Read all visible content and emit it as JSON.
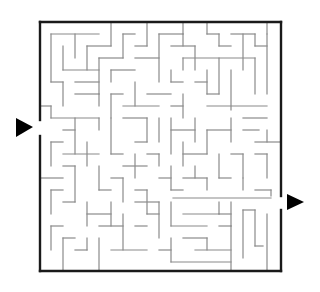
{
  "puzzle": {
    "type": "maze",
    "background": "#ffffff",
    "frame_color": "#1a1a1a",
    "wall_color": "#8a8a8a",
    "arrow_color": "#000000",
    "entrance": {
      "side": "left",
      "label": "entrance-arrow"
    },
    "exit": {
      "side": "right",
      "label": "exit-arrow"
    }
  },
  "frame": {
    "x1": 40,
    "y1": 22,
    "x2": 281,
    "y2": 271
  },
  "walls": [
    [
      51,
      34,
      51,
      82
    ],
    [
      51,
      34,
      99,
      34
    ],
    [
      75,
      34,
      75,
      58
    ],
    [
      63,
      46,
      63,
      70
    ],
    [
      63,
      70,
      99,
      70
    ],
    [
      87,
      46,
      87,
      70
    ],
    [
      111,
      22,
      111,
      46
    ],
    [
      87,
      46,
      111,
      46
    ],
    [
      99,
      58,
      99,
      94
    ],
    [
      99,
      58,
      123,
      58
    ],
    [
      123,
      34,
      123,
      58
    ],
    [
      123,
      34,
      135,
      34
    ],
    [
      135,
      46,
      147,
      46
    ],
    [
      111,
      70,
      135,
      70
    ],
    [
      111,
      70,
      111,
      82
    ],
    [
      147,
      22,
      147,
      46
    ],
    [
      159,
      34,
      159,
      82
    ],
    [
      135,
      58,
      159,
      58
    ],
    [
      159,
      34,
      183,
      34
    ],
    [
      183,
      34,
      183,
      46
    ],
    [
      171,
      46,
      195,
      46
    ],
    [
      195,
      46,
      195,
      70
    ],
    [
      183,
      22,
      183,
      34
    ],
    [
      207,
      22,
      207,
      34
    ],
    [
      207,
      34,
      219,
      34
    ],
    [
      219,
      34,
      219,
      46
    ],
    [
      219,
      46,
      231,
      46
    ],
    [
      231,
      34,
      255,
      34
    ],
    [
      243,
      34,
      243,
      70
    ],
    [
      255,
      34,
      255,
      46
    ],
    [
      255,
      46,
      267,
      46
    ],
    [
      267,
      34,
      267,
      94
    ],
    [
      267,
      22,
      267,
      34
    ],
    [
      183,
      58,
      255,
      58
    ],
    [
      183,
      58,
      183,
      70
    ],
    [
      219,
      58,
      219,
      94
    ],
    [
      207,
      70,
      207,
      94
    ],
    [
      255,
      58,
      255,
      94
    ],
    [
      171,
      82,
      183,
      82
    ],
    [
      171,
      70,
      171,
      82
    ],
    [
      195,
      82,
      207,
      82
    ],
    [
      207,
      94,
      219,
      94
    ],
    [
      231,
      70,
      231,
      110
    ],
    [
      207,
      106,
      267,
      106
    ],
    [
      171,
      106,
      183,
      106
    ],
    [
      183,
      94,
      183,
      118
    ],
    [
      51,
      82,
      63,
      82
    ],
    [
      63,
      82,
      63,
      106
    ],
    [
      75,
      82,
      99,
      82
    ],
    [
      75,
      94,
      99,
      94
    ],
    [
      99,
      94,
      99,
      106
    ],
    [
      111,
      94,
      123,
      94
    ],
    [
      111,
      94,
      111,
      118
    ],
    [
      135,
      82,
      135,
      106
    ],
    [
      123,
      106,
      159,
      106
    ],
    [
      147,
      94,
      171,
      94
    ],
    [
      40,
      106,
      51,
      106
    ],
    [
      51,
      106,
      51,
      118
    ],
    [
      51,
      118,
      99,
      118
    ],
    [
      63,
      130,
      75,
      130
    ],
    [
      75,
      118,
      75,
      154
    ],
    [
      99,
      118,
      99,
      130
    ],
    [
      111,
      118,
      111,
      154
    ],
    [
      111,
      154,
      123,
      154
    ],
    [
      123,
      118,
      147,
      118
    ],
    [
      147,
      118,
      147,
      142
    ],
    [
      135,
      142,
      147,
      142
    ],
    [
      159,
      118,
      159,
      142
    ],
    [
      171,
      118,
      171,
      154
    ],
    [
      171,
      130,
      195,
      130
    ],
    [
      195,
      118,
      195,
      142
    ],
    [
      207,
      130,
      207,
      154
    ],
    [
      207,
      130,
      231,
      130
    ],
    [
      231,
      118,
      231,
      142
    ],
    [
      243,
      118,
      267,
      118
    ],
    [
      243,
      130,
      259,
      130
    ],
    [
      255,
      142,
      281,
      142
    ],
    [
      267,
      130,
      267,
      142
    ],
    [
      51,
      142,
      63,
      142
    ],
    [
      51,
      142,
      51,
      166
    ],
    [
      63,
      154,
      99,
      154
    ],
    [
      87,
      142,
      87,
      166
    ],
    [
      123,
      166,
      147,
      166
    ],
    [
      135,
      154,
      135,
      178
    ],
    [
      147,
      154,
      159,
      154
    ],
    [
      159,
      154,
      159,
      166
    ],
    [
      183,
      142,
      183,
      166
    ],
    [
      183,
      154,
      207,
      154
    ],
    [
      219,
      154,
      219,
      178
    ],
    [
      231,
      154,
      243,
      154
    ],
    [
      243,
      154,
      243,
      178
    ],
    [
      255,
      154,
      267,
      154
    ],
    [
      267,
      154,
      267,
      178
    ],
    [
      40,
      178,
      63,
      178
    ],
    [
      63,
      166,
      75,
      166
    ],
    [
      75,
      166,
      75,
      202
    ],
    [
      99,
      166,
      99,
      190
    ],
    [
      99,
      190,
      111,
      190
    ],
    [
      111,
      178,
      123,
      178
    ],
    [
      123,
      178,
      123,
      202
    ],
    [
      135,
      190,
      147,
      190
    ],
    [
      147,
      190,
      147,
      214
    ],
    [
      159,
      178,
      171,
      178
    ],
    [
      171,
      166,
      171,
      190
    ],
    [
      171,
      190,
      183,
      190
    ],
    [
      195,
      166,
      195,
      178
    ],
    [
      183,
      178,
      207,
      178
    ],
    [
      207,
      178,
      207,
      190
    ],
    [
      219,
      178,
      231,
      178
    ],
    [
      243,
      178,
      243,
      190
    ],
    [
      255,
      190,
      271,
      190
    ],
    [
      271,
      190,
      271,
      196
    ],
    [
      173,
      198,
      271,
      198
    ],
    [
      51,
      190,
      63,
      190
    ],
    [
      51,
      190,
      51,
      214
    ],
    [
      63,
      202,
      75,
      202
    ],
    [
      87,
      202,
      87,
      226
    ],
    [
      87,
      214,
      111,
      214
    ],
    [
      111,
      202,
      111,
      226
    ],
    [
      99,
      226,
      123,
      226
    ],
    [
      123,
      214,
      123,
      250
    ],
    [
      135,
      202,
      159,
      202
    ],
    [
      147,
      214,
      159,
      214
    ],
    [
      159,
      202,
      159,
      238
    ],
    [
      111,
      250,
      147,
      250
    ],
    [
      135,
      226,
      147,
      226
    ],
    [
      171,
      202,
      171,
      226
    ],
    [
      171,
      226,
      207,
      226
    ],
    [
      183,
      214,
      219,
      214
    ],
    [
      219,
      202,
      219,
      214
    ],
    [
      219,
      214,
      231,
      214
    ],
    [
      231,
      202,
      231,
      226
    ],
    [
      219,
      226,
      231,
      226
    ],
    [
      243,
      210,
      243,
      258
    ],
    [
      243,
      210,
      255,
      210
    ],
    [
      255,
      210,
      255,
      246
    ],
    [
      255,
      246,
      263,
      246
    ],
    [
      51,
      226,
      63,
      226
    ],
    [
      51,
      226,
      51,
      250
    ],
    [
      63,
      238,
      75,
      238
    ],
    [
      63,
      238,
      63,
      271
    ],
    [
      75,
      250,
      87,
      250
    ],
    [
      87,
      238,
      87,
      250
    ],
    [
      99,
      238,
      99,
      271
    ],
    [
      159,
      250,
      171,
      250
    ],
    [
      171,
      238,
      171,
      262
    ],
    [
      171,
      262,
      231,
      262
    ],
    [
      183,
      238,
      207,
      238
    ],
    [
      207,
      238,
      207,
      250
    ],
    [
      195,
      250,
      231,
      250
    ],
    [
      231,
      226,
      231,
      271
    ],
    [
      267,
      214,
      267,
      271
    ]
  ]
}
